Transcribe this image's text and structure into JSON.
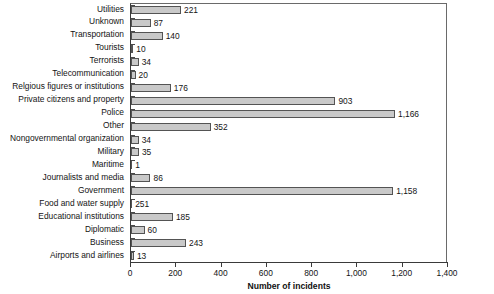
{
  "chart_data": {
    "type": "bar",
    "orientation": "horizontal",
    "title": "",
    "xlabel": "Number of incidents",
    "ylabel": "",
    "xlim": [
      0,
      1400
    ],
    "xticks": [
      "0",
      "200",
      "400",
      "600",
      "800",
      "1,000",
      "1,200",
      "1,400"
    ],
    "xtick_values": [
      0,
      200,
      400,
      600,
      800,
      1000,
      1200,
      1400
    ],
    "grid": false,
    "legend": null,
    "categories": [
      "Utilities",
      "Unknown",
      "Transportation",
      "Tourists",
      "Terrorists",
      "Telecommunication",
      "Relgious figures or institutions",
      "Private citizens and property",
      "Police",
      "Other",
      "Nongovernmental organization",
      "Military",
      "Maritime",
      "Journalists and media",
      "Government",
      "Food and water supply",
      "Educational institutions",
      "Diplomatic",
      "Business",
      "Airports and airlines"
    ],
    "values": [
      221,
      87,
      140,
      10,
      34,
      20,
      176,
      903,
      1166,
      352,
      34,
      35,
      1,
      86,
      1158,
      251,
      185,
      60,
      243,
      13
    ],
    "value_labels": [
      "221",
      "87",
      "140",
      "10",
      "34",
      "20",
      "176",
      "903",
      "1,166",
      "352",
      "34",
      "35",
      "1",
      "86",
      "1,158",
      "251",
      "185",
      "60",
      "243",
      "13"
    ],
    "bar_draw_values": [
      221,
      87,
      140,
      10,
      34,
      20,
      176,
      903,
      1166,
      352,
      34,
      35,
      1,
      86,
      1158,
      1,
      185,
      60,
      243,
      13
    ],
    "colors": {
      "bar_fill": "#c9c9c9",
      "bar_outline": "#545454",
      "axis": "#3a3a3a",
      "text": "#141414",
      "background": "#ffffff"
    }
  }
}
